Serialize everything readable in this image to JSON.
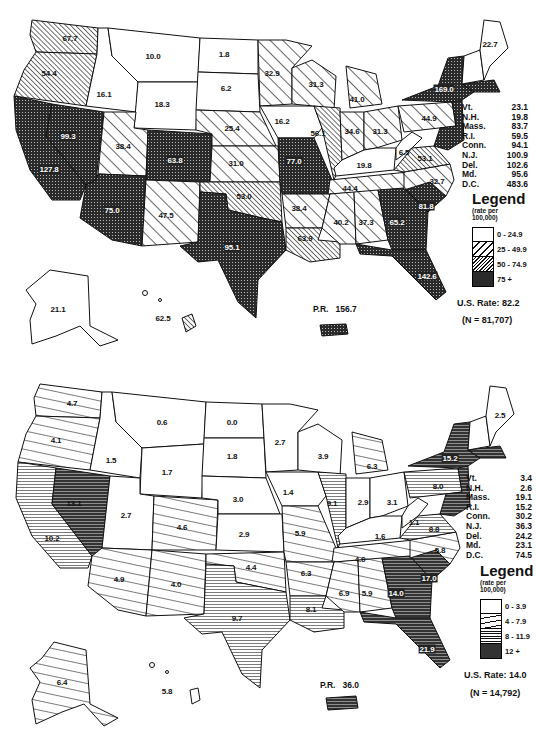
{
  "colors": {
    "ink": "#111111",
    "paper": "#ffffff",
    "dark_fill": "#2a2a2a"
  },
  "maps": [
    {
      "id": "top",
      "legend": {
        "title": "Legend",
        "subtitle_line1": "(rate per",
        "subtitle_line2": "100,000)",
        "bins": [
          {
            "range": "0 - 24.9",
            "pattern": "blank"
          },
          {
            "range": "25 - 49.9",
            "pattern": "wide-diagonal"
          },
          {
            "range": "50 - 74.9",
            "pattern": "dense-diagonal"
          },
          {
            "range": "75 +",
            "pattern": "crosshatch-dark"
          }
        ]
      },
      "us_rate": "U.S. Rate: 82.2",
      "n": "(N = 81,707)",
      "pr": {
        "label": "P.R.",
        "value": "156.7"
      },
      "small_states": [
        {
          "state": "Vt.",
          "value": "23.1"
        },
        {
          "state": "N.H.",
          "value": "19.8"
        },
        {
          "state": "Mass.",
          "value": "83.7"
        },
        {
          "state": "R.I.",
          "value": "59.5"
        },
        {
          "state": "Conn.",
          "value": "94.1"
        },
        {
          "state": "N.J.",
          "value": "100.9"
        },
        {
          "state": "Del.",
          "value": "102.6"
        },
        {
          "state": "Md.",
          "value": "95.6"
        },
        {
          "state": "D.C.",
          "value": "483.6"
        }
      ],
      "state_labels": {
        "WA": "67.7",
        "OR": "54.4",
        "CA": "127.8",
        "NV": "99.3",
        "ID": "16.1",
        "MT": "10.0",
        "WY": "18.3",
        "UT": "38.4",
        "AZ": "75.0",
        "CO": "63.8",
        "NM": "47.5",
        "ND": "1.8",
        "SD": "6.2",
        "NE": "25.4",
        "KS": "31.0",
        "OK": "53.0",
        "TX": "95.1",
        "MN": "32.9",
        "IA": "16.2",
        "MO": "77.0",
        "AR": "38.4",
        "LA": "63.9",
        "WI": "31.3",
        "IL": "56.1",
        "MI": "41.0",
        "IN": "34.6",
        "OH": "31.3",
        "KY": "19.8",
        "TN": "44.4",
        "MS": "40.2",
        "AL": "37.3",
        "GA": "65.2",
        "FL": "142.6",
        "SC": "81.8",
        "NC": "32.7",
        "VA": "53.1",
        "WV": "6.5",
        "PA": "44.9",
        "NY": "169.0",
        "ME": "22.7",
        "AK": "21.1",
        "HI": "62.5"
      }
    },
    {
      "id": "bottom",
      "legend": {
        "title": "Legend",
        "subtitle_line1": "(rate per",
        "subtitle_line2": "100,000)",
        "bins": [
          {
            "range": "0 - 3.9",
            "pattern": "blank"
          },
          {
            "range": "4 - 7.9",
            "pattern": "wide-horizontal"
          },
          {
            "range": "8 - 11.9",
            "pattern": "dense-horizontal"
          },
          {
            "range": "12 +",
            "pattern": "crosshatch-dark"
          }
        ]
      },
      "us_rate": "U.S. Rate: 14.0",
      "n": "(N = 14,792)",
      "pr": {
        "label": "P.R.",
        "value": "36.0"
      },
      "small_states": [
        {
          "state": "Vt.",
          "value": "3.4"
        },
        {
          "state": "N.H.",
          "value": "2.6"
        },
        {
          "state": "Mass.",
          "value": "19.1"
        },
        {
          "state": "R.I.",
          "value": "15.2"
        },
        {
          "state": "Conn.",
          "value": "30.2"
        },
        {
          "state": "N.J.",
          "value": "36.3"
        },
        {
          "state": "Del.",
          "value": "24.2"
        },
        {
          "state": "Md.",
          "value": "23.1"
        },
        {
          "state": "D.C.",
          "value": "74.5"
        }
      ],
      "state_labels": {
        "WA": "4.7",
        "OR": "4.1",
        "CA": "10.2",
        "NV": "13.1",
        "ID": "1.5",
        "MT": "0.6",
        "WY": "1.7",
        "UT": "2.7",
        "AZ": "4.9",
        "CO": "4.6",
        "NM": "4.0",
        "ND": "0.0",
        "SD": "1.8",
        "NE": "3.0",
        "KS": "2.9",
        "OK": "4.4",
        "TX": "9.7",
        "MN": "2.7",
        "IA": "1.4",
        "MO": "5.9",
        "AR": "6.3",
        "LA": "8.1",
        "WI": "3.9",
        "IL": "9.1",
        "MI": "6.3",
        "IN": "2.9",
        "OH": "3.1",
        "KY": "1.6",
        "TN": "4.6",
        "MS": "6.9",
        "AL": "5.9",
        "GA": "14.0",
        "FL": "21.9",
        "SC": "17.0",
        "NC": "5.8",
        "VA": "8.8",
        "WV": "1.1",
        "PA": "8.0",
        "NY": "15.2",
        "ME": "2.5",
        "AK": "6.4",
        "HI": "5.8"
      }
    }
  ]
}
